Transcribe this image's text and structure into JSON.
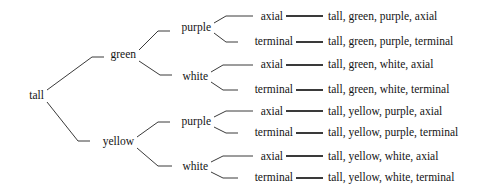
{
  "diagram": {
    "type": "probability-tree",
    "title": "",
    "background_color": "#ffffff",
    "line_color": "#3a3a3a",
    "text_color": "#141414",
    "levels": [
      {
        "name": "height",
        "label": "height"
      },
      {
        "name": "pod-color",
        "label": "pod color"
      },
      {
        "name": "flower-color",
        "label": "flower color"
      },
      {
        "name": "flower-position",
        "label": "flower position"
      }
    ],
    "root": {
      "label": "tall",
      "x": 30,
      "y": 96
    },
    "level1": [
      {
        "label": "green",
        "x": 115,
        "y": 55
      },
      {
        "label": "yellow",
        "x": 113,
        "y": 142
      }
    ],
    "level2": [
      {
        "label": "purple",
        "x": 191,
        "y": 28
      },
      {
        "label": "white",
        "x": 192,
        "y": 77
      },
      {
        "label": "purple",
        "x": 191,
        "y": 122
      },
      {
        "label": "white",
        "x": 192,
        "y": 167
      }
    ],
    "level3": [
      {
        "label": "axial",
        "x": 277,
        "y": 17
      },
      {
        "label": "terminal",
        "x": 277,
        "y": 42
      },
      {
        "label": "axial",
        "x": 277,
        "y": 65
      },
      {
        "label": "terminal",
        "x": 277,
        "y": 90
      },
      {
        "label": "axial",
        "x": 277,
        "y": 112
      },
      {
        "label": "terminal",
        "x": 277,
        "y": 133
      },
      {
        "label": "axial",
        "x": 277,
        "y": 157
      },
      {
        "label": "terminal",
        "x": 277,
        "y": 178
      }
    ],
    "outcomes": [
      {
        "label": "tall, green, purple, axial",
        "x": 328,
        "y": 17
      },
      {
        "label": "tall, green, purple, terminal",
        "x": 328,
        "y": 42
      },
      {
        "label": "tall, green, white, axial",
        "x": 328,
        "y": 65
      },
      {
        "label": "tall, green, white, terminal",
        "x": 328,
        "y": 90
      },
      {
        "label": "tall, yellow, purple, axial",
        "x": 328,
        "y": 112
      },
      {
        "label": "tall, yellow, purple, terminal",
        "x": 328,
        "y": 133
      },
      {
        "label": "tall, yellow, white, axial",
        "x": 328,
        "y": 157
      },
      {
        "label": "tall, yellow, white, terminal",
        "x": 328,
        "y": 178
      }
    ],
    "outcome_count": 8
  }
}
